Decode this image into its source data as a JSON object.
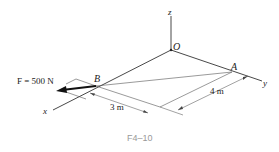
{
  "figure": {
    "caption": "F4–10",
    "force_label": "F = 500 N",
    "points": {
      "origin": "O",
      "a": "A",
      "b": "B"
    },
    "axes": {
      "x": "x",
      "y": "y",
      "z": "z"
    },
    "dimensions": {
      "along_y": "3 m",
      "along_x": "4 m"
    }
  }
}
